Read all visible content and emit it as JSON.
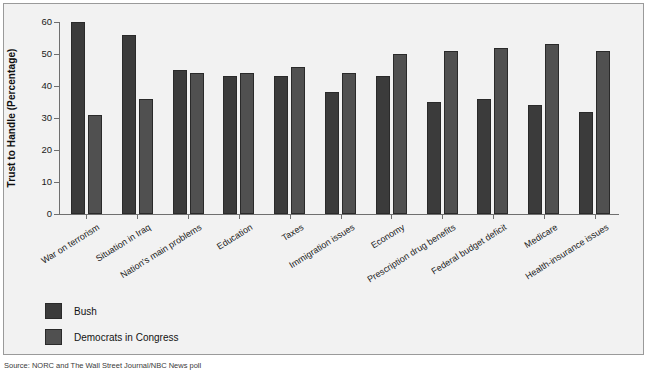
{
  "chart_data": {
    "type": "bar",
    "title": "",
    "xlabel": "",
    "ylabel": "Trust to Handle (Percentage)",
    "ylim": [
      0,
      60
    ],
    "yticks": [
      0,
      10,
      20,
      30,
      40,
      50,
      60
    ],
    "grid": false,
    "legend_position": "bottom-left",
    "categories": [
      "War on terrorism",
      "Situation in Iraq",
      "Nation's main problems",
      "Education",
      "Taxes",
      "Immigration issues",
      "Economy",
      "Prescription drug benefits",
      "Federal budget deficit",
      "Medicare",
      "Health-insurance issues"
    ],
    "series": [
      {
        "name": "Bush",
        "color": "#3b3b3b",
        "values": [
          60,
          56,
          45,
          43,
          43,
          38,
          43,
          35,
          36,
          34,
          32
        ]
      },
      {
        "name": "Democrats in Congress",
        "color": "#505050",
        "values": [
          31,
          36,
          44,
          44,
          46,
          44,
          50,
          51,
          52,
          53,
          51
        ]
      }
    ]
  },
  "legend": {
    "items": [
      {
        "label": "Bush"
      },
      {
        "label": "Democrats in Congress"
      }
    ]
  },
  "source_note": "Source: NORC and The Wall Street Journal/NBC News poll"
}
